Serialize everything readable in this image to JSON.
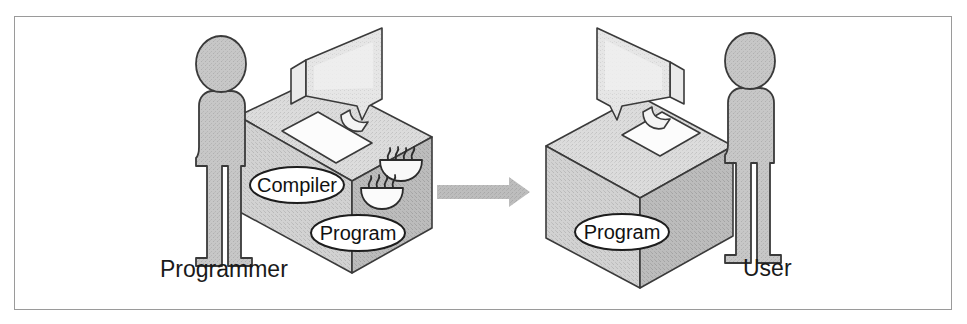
{
  "figure": {
    "frame_border_color": "#9a9a9a",
    "background_color": "#ffffff"
  },
  "palette": {
    "box_top": "#d9d9d9",
    "box_front_left": "#d2d2d2",
    "box_front_right": "#bdbdbd",
    "box_outline": "#3a3a3a",
    "person_fill": "#c4c4c4",
    "person_outline": "#3a3a3a",
    "monitor_screen": "#e3e3e3",
    "monitor_body": "#f2f2f2",
    "keyboard_fill": "#fbfbfb",
    "arrow_fill": "#b7b7b7",
    "oval_fill": "#ffffff",
    "text_color": "#1a1a1a"
  },
  "left_group": {
    "name": "compile-time-scene",
    "person": {
      "label": "Programmer",
      "label_x": 160,
      "label_y": 277
    },
    "desk_labels": [
      {
        "id": "compiler-oval",
        "text": "Compiler",
        "cx": 297,
        "cy": 185,
        "rx": 46,
        "ry": 18
      },
      {
        "id": "program-oval",
        "text": "Program",
        "cx": 358,
        "cy": 233,
        "rx": 46,
        "ry": 18
      }
    ],
    "coffee_cups": [
      {
        "id": "coffee-cup-upper",
        "cx": 401,
        "cy": 163
      },
      {
        "id": "coffee-cup-lower",
        "cx": 382,
        "cy": 191
      }
    ],
    "has_monitor": true,
    "has_keyboard": true
  },
  "arrow": {
    "name": "transfer-arrow",
    "direction": "right",
    "x1": 437,
    "x2": 529,
    "y": 192,
    "thickness": 14
  },
  "right_group": {
    "name": "runtime-scene",
    "person": {
      "label": "User",
      "label_x": 743,
      "label_y": 273
    },
    "desk_labels": [
      {
        "id": "program-oval-user",
        "text": "Program",
        "cx": 622,
        "cy": 232,
        "rx": 46,
        "ry": 18
      }
    ],
    "has_monitor": true,
    "has_keyboard": true
  }
}
